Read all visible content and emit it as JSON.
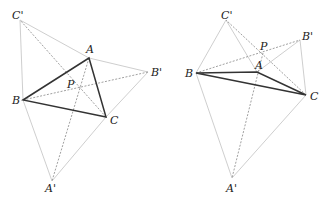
{
  "figures": [
    {
      "id": "left",
      "points": {
        "A": {
          "x": 89,
          "y": 58,
          "label": "A",
          "lx": 86,
          "ly": 53
        },
        "B": {
          "x": 23,
          "y": 100,
          "label": "B",
          "lx": 12,
          "ly": 104
        },
        "C": {
          "x": 106,
          "y": 117,
          "label": "C",
          "lx": 110,
          "ly": 124
        },
        "A'": {
          "x": 52,
          "y": 181,
          "label": "A'",
          "lx": 45,
          "ly": 192
        },
        "B'": {
          "x": 148,
          "y": 72,
          "label": "B'",
          "lx": 151,
          "ly": 76
        },
        "C'": {
          "x": 20,
          "y": 20,
          "label": "C'",
          "lx": 12,
          "ly": 19
        },
        "P": {
          "x": 79,
          "y": 88,
          "label": "P",
          "lx": 67,
          "ly": 88
        }
      }
    },
    {
      "id": "right",
      "points": {
        "A": {
          "x": 257,
          "y": 72,
          "label": "A",
          "lx": 255,
          "ly": 69
        },
        "B": {
          "x": 196,
          "y": 73,
          "label": "B",
          "lx": 185,
          "ly": 77
        },
        "C": {
          "x": 306,
          "y": 95,
          "label": "C",
          "lx": 310,
          "ly": 100
        },
        "A'": {
          "x": 232,
          "y": 178,
          "label": "A'",
          "lx": 226,
          "ly": 192
        },
        "B'": {
          "x": 300,
          "y": 40,
          "label": "B'",
          "lx": 302,
          "ly": 40
        },
        "C'": {
          "x": 226,
          "y": 20,
          "label": "C'",
          "lx": 221,
          "ly": 19
        },
        "P": {
          "x": 263,
          "y": 53,
          "label": "P",
          "lx": 260,
          "ly": 50
        }
      }
    }
  ],
  "labels": {
    "left": {
      "A": "A",
      "B": "B",
      "C": "C",
      "A_prime": "A'",
      "B_prime": "B'",
      "C_prime": "C'",
      "P": "P"
    },
    "right": {
      "A": "A",
      "B": "B",
      "C": "C",
      "A_prime": "A'",
      "B_prime": "B'",
      "C_prime": "C'",
      "P": "P"
    }
  },
  "colors": {
    "triangle": "#333333",
    "equilateral_sides": "#c8c8c8",
    "cevians": "#888888"
  }
}
